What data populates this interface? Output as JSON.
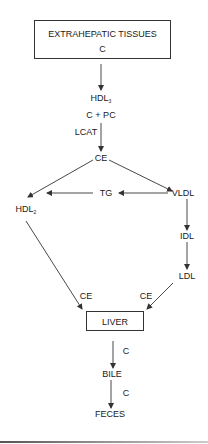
{
  "diagram": {
    "title_box": {
      "line1": "EXTRAHEPATIC TISSUES",
      "line2": "C"
    },
    "nodes": {
      "hdl3": {
        "base": "HDL",
        "sub": "3"
      },
      "c_plus_pc": "C + PC",
      "lcat": "LCAT",
      "ce": "CE",
      "tg": "TG",
      "vldl": "VLDL",
      "hdl2": {
        "base": "HDL",
        "sub": "2"
      },
      "idl": "IDL",
      "ldl": "LDL",
      "liver": "LIVER",
      "bile": "BILE",
      "feces": "FECES"
    },
    "edge_labels": {
      "hdl2_to_liver": "CE",
      "ldl_to_liver": "CE",
      "liver_to_bile": "C",
      "bile_to_feces": "C"
    },
    "colors": {
      "line": "#333333",
      "text": "#1a1a1a",
      "background": "#ffffff"
    }
  }
}
